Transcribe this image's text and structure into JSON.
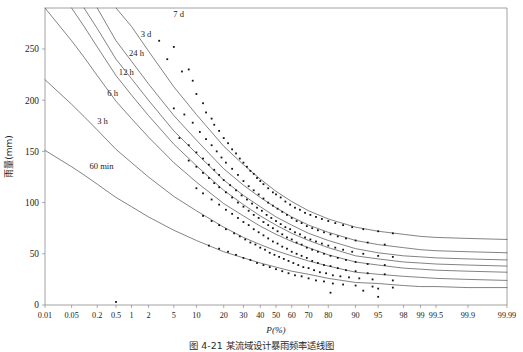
{
  "figure": {
    "caption": "图 4-21  某流域设计暴雨频率适线图",
    "y_axis_label": "雨量(mm)",
    "x_axis_label": "P(%)"
  },
  "chart_data": {
    "type": "scatter",
    "title": "",
    "subtitle": "",
    "xlabel": "P(%)",
    "ylabel": "雨量(mm)",
    "xscale": "probability",
    "grid": false,
    "legend_position": "inline-curve-labels",
    "ylim": [
      0,
      290
    ],
    "yticks": [
      0,
      50,
      100,
      150,
      200,
      250
    ],
    "ytick_labels": [
      "0",
      "50",
      "100",
      "150",
      "200",
      "250"
    ],
    "xlim": [
      0.01,
      99.99
    ],
    "xticks": [
      0.01,
      0.05,
      0.2,
      0.5,
      1,
      2,
      5,
      10,
      20,
      30,
      40,
      50,
      60,
      70,
      80,
      90,
      95,
      98,
      99,
      99.5,
      99.9,
      99.99
    ],
    "xtick_labels": [
      "0.01",
      "0.05",
      "0.2",
      "0.5",
      "1",
      "2",
      "5",
      "10",
      "20",
      "30",
      "40",
      "50",
      "60",
      "70",
      "80",
      "90",
      "95",
      "98",
      "99",
      "99.5",
      "99.9",
      "99.99"
    ],
    "annotations": [
      {
        "text": "7 d",
        "x": 4.6,
        "y": 281
      },
      {
        "text": "3 d",
        "x": 1.35,
        "y": 262
      },
      {
        "text": "24 h",
        "x": 0.82,
        "y": 243
      },
      {
        "text": "12 h",
        "x": 0.52,
        "y": 225
      },
      {
        "text": "6 h",
        "x": 0.3,
        "y": 204
      },
      {
        "text": "3 h",
        "x": 0.18,
        "y": 177
      },
      {
        "text": "60 min",
        "x": 0.12,
        "y": 133
      }
    ],
    "series": [
      {
        "name": "7 d",
        "curve_x": [
          0.5,
          1,
          2,
          5,
          10,
          20,
          30,
          40,
          50,
          60,
          70,
          80,
          90,
          95,
          98,
          99,
          99.5,
          99.9,
          99.99
        ],
        "curve_y": [
          290,
          272,
          248,
          213,
          186,
          155,
          137,
          123,
          111,
          101,
          92,
          84,
          76,
          72,
          69,
          67,
          66,
          65,
          64
        ],
        "points_x": [
          3,
          4,
          5,
          6.5,
          8,
          9,
          10,
          12,
          13,
          15,
          16,
          18,
          20,
          22,
          24,
          26,
          28,
          30,
          32,
          34,
          36,
          38,
          40,
          42,
          45,
          48,
          50,
          53,
          56,
          59,
          62,
          65,
          68,
          71,
          74,
          77,
          80,
          83,
          86,
          89,
          92,
          95,
          97
        ],
        "points_y": [
          258,
          240,
          252,
          228,
          230,
          219,
          206,
          197,
          188,
          182,
          176,
          170,
          163,
          158,
          152,
          148,
          143,
          139,
          135,
          131,
          128,
          124,
          121,
          118,
          114,
          110,
          108,
          105,
          101,
          98,
          95,
          93,
          90,
          88,
          86,
          84,
          82,
          80,
          78,
          76,
          74,
          72,
          70
        ]
      },
      {
        "name": "3 d",
        "curve_x": [
          0.2,
          0.5,
          1,
          2,
          5,
          10,
          20,
          30,
          40,
          50,
          60,
          70,
          80,
          90,
          95,
          98,
          99,
          99.5,
          99.9,
          99.99
        ],
        "curve_y": [
          290,
          258,
          238,
          216,
          185,
          161,
          133,
          117,
          105,
          95,
          86,
          78,
          71,
          63,
          59,
          56,
          54,
          53,
          52,
          51
        ],
        "points_x": [
          5,
          7,
          9,
          11,
          13,
          15,
          17,
          19,
          21,
          24,
          27,
          30,
          33,
          36,
          39,
          42,
          45,
          48,
          51,
          54,
          57,
          60,
          63,
          66,
          69,
          72,
          75,
          78,
          81,
          84,
          87,
          90,
          93,
          96
        ],
        "points_y": [
          192,
          186,
          178,
          169,
          162,
          156,
          150,
          144,
          139,
          133,
          127,
          121,
          116,
          112,
          108,
          104,
          100,
          97,
          94,
          91,
          88,
          85,
          82,
          80,
          77,
          75,
          73,
          71,
          69,
          67,
          65,
          63,
          61,
          59
        ]
      },
      {
        "name": "24 h",
        "curve_x": [
          0.1,
          0.2,
          0.5,
          1,
          2,
          5,
          10,
          20,
          30,
          40,
          50,
          60,
          70,
          80,
          90,
          95,
          98,
          99,
          99.5,
          99.9,
          99.99
        ],
        "curve_y": [
          290,
          270,
          240,
          221,
          200,
          170,
          148,
          122,
          107,
          96,
          86,
          78,
          70,
          63,
          55,
          51,
          48,
          47,
          46,
          45,
          44
        ],
        "points_x": [
          6,
          8,
          10,
          12,
          14,
          16,
          18,
          20,
          23,
          26,
          29,
          32,
          35,
          38,
          41,
          44,
          47,
          50,
          53,
          56,
          59,
          62,
          65,
          68,
          71,
          74,
          77,
          80,
          83,
          86,
          89,
          92,
          95,
          97
        ],
        "points_y": [
          163,
          156,
          149,
          143,
          137,
          132,
          127,
          122,
          117,
          112,
          107,
          103,
          99,
          95,
          92,
          88,
          85,
          82,
          79,
          76,
          74,
          71,
          69,
          66,
          64,
          62,
          60,
          58,
          56,
          54,
          52,
          50,
          48,
          47
        ]
      },
      {
        "name": "12 h",
        "curve_x": [
          0.05,
          0.1,
          0.2,
          0.5,
          1,
          2,
          5,
          10,
          20,
          30,
          40,
          50,
          60,
          70,
          80,
          90,
          95,
          98,
          99,
          99.5,
          99.9,
          99.99
        ],
        "curve_y": [
          290,
          272,
          252,
          224,
          205,
          185,
          157,
          136,
          112,
          98,
          87,
          78,
          70,
          63,
          56,
          48,
          45,
          42,
          41,
          40,
          39,
          38
        ],
        "points_x": [
          8,
          10,
          12,
          14,
          16,
          18,
          21,
          24,
          27,
          30,
          33,
          36,
          39,
          42,
          45,
          48,
          51,
          54,
          57,
          60,
          63,
          66,
          69,
          72,
          75,
          78,
          81,
          84,
          87,
          90,
          93,
          96
        ],
        "points_y": [
          141,
          135,
          129,
          124,
          119,
          115,
          110,
          105,
          100,
          96,
          92,
          88,
          85,
          81,
          78,
          75,
          72,
          69,
          66,
          64,
          61,
          59,
          56,
          54,
          52,
          50,
          48,
          46,
          44,
          42,
          40,
          39
        ]
      },
      {
        "name": "6 h",
        "curve_x": [
          0.01,
          0.05,
          0.1,
          0.2,
          0.5,
          1,
          2,
          5,
          10,
          20,
          30,
          40,
          50,
          60,
          70,
          80,
          90,
          95,
          98,
          99,
          99.5,
          99.9,
          99.99
        ],
        "curve_y": [
          290,
          258,
          242,
          224,
          199,
          182,
          164,
          139,
          120,
          99,
          87,
          77,
          69,
          62,
          56,
          49,
          42,
          39,
          36,
          35,
          34,
          33,
          32
        ],
        "points_x": [
          10,
          12,
          15,
          18,
          21,
          24,
          27,
          30,
          33,
          36,
          39,
          42,
          45,
          48,
          51,
          54,
          57,
          60,
          63,
          66,
          69,
          72,
          75,
          78,
          81,
          84,
          87,
          90,
          93,
          96
        ],
        "points_y": [
          114,
          109,
          103,
          98,
          93,
          89,
          85,
          81,
          78,
          74,
          71,
          68,
          65,
          62,
          60,
          57,
          55,
          52,
          50,
          48,
          46,
          43,
          41,
          39,
          38,
          36,
          34,
          33,
          31,
          30
        ]
      },
      {
        "name": "3 h",
        "curve_x": [
          0.01,
          0.05,
          0.1,
          0.2,
          0.5,
          1,
          2,
          5,
          10,
          20,
          30,
          40,
          50,
          60,
          70,
          80,
          90,
          95,
          98,
          99,
          99.5,
          99.9,
          99.99
        ],
        "curve_y": [
          220,
          196,
          184,
          171,
          152,
          139,
          125,
          106,
          92,
          76,
          66,
          59,
          53,
          48,
          43,
          38,
          32,
          30,
          28,
          27,
          26,
          25,
          24
        ],
        "points_x": [
          12,
          15,
          18,
          21,
          25,
          28,
          31,
          34,
          37,
          40,
          43,
          46,
          49,
          52,
          55,
          58,
          61,
          64,
          67,
          70,
          73,
          76,
          79,
          82,
          85,
          88,
          91,
          94,
          97
        ],
        "points_y": [
          87,
          82,
          78,
          74,
          70,
          67,
          64,
          61,
          59,
          56,
          54,
          51,
          49,
          47,
          45,
          43,
          41,
          39,
          37,
          36,
          34,
          32,
          31,
          29,
          28,
          27,
          26,
          25,
          24
        ]
      },
      {
        "name": "60 min",
        "curve_x": [
          0.01,
          0.05,
          0.1,
          0.2,
          0.5,
          1,
          2,
          5,
          10,
          20,
          30,
          40,
          50,
          60,
          70,
          80,
          90,
          95,
          98,
          99,
          99.5,
          99.9,
          99.99
        ],
        "curve_y": [
          151,
          135,
          127,
          118,
          105,
          96,
          86,
          73,
          63,
          52,
          46,
          41,
          37,
          33,
          30,
          26,
          22,
          21,
          19,
          18,
          18,
          17,
          17
        ],
        "points_x": [
          14,
          18,
          22,
          26,
          30,
          34,
          38,
          42,
          46,
          50,
          54,
          58,
          62,
          66,
          70,
          74,
          78,
          82,
          86,
          90,
          94,
          97
        ],
        "points_y": [
          58,
          55,
          52,
          49,
          46,
          44,
          41,
          39,
          37,
          35,
          33,
          31,
          29,
          28,
          26,
          24,
          23,
          21,
          20,
          19,
          18,
          17
        ]
      }
    ],
    "outlier_points": [
      {
        "x": 0.5,
        "y": 3
      },
      {
        "x": 92,
        "y": 14
      },
      {
        "x": 95,
        "y": 8
      },
      {
        "x": 95,
        "y": 16
      },
      {
        "x": 81,
        "y": 12
      }
    ]
  }
}
